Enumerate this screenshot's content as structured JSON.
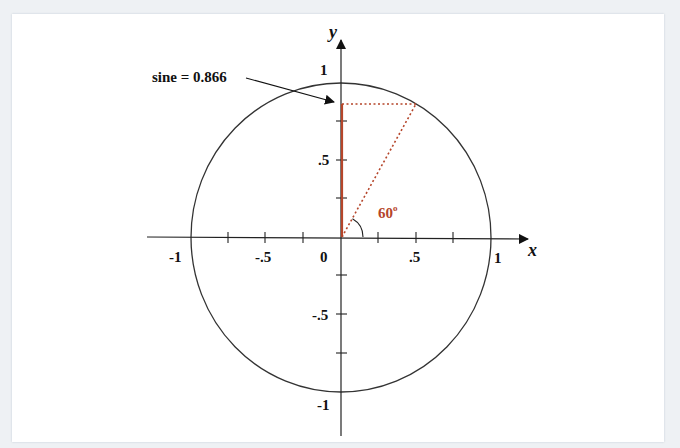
{
  "diagram": {
    "annotation": {
      "label": "sine = 0.866"
    },
    "angle_label": {
      "value": "60",
      "superscript": "o"
    },
    "axes": {
      "x_label": "x",
      "y_label": "y",
      "x_ticks": [
        "-1",
        "-.5",
        "0",
        ".5",
        "1"
      ],
      "y_ticks": [
        "1",
        ".5",
        "-.5",
        "-1"
      ]
    },
    "colors": {
      "axis": "#222222",
      "circle": "#333333",
      "sine_line": "#b5452a",
      "dotted": "#b5452a",
      "background": "#ffffff"
    },
    "values": {
      "angle_degrees": 60,
      "sine": 0.866,
      "cosine": 0.5
    }
  }
}
